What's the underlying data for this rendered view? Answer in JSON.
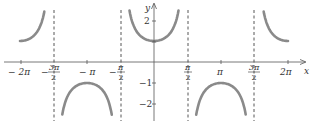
{
  "chart_data": {
    "type": "line",
    "title": "",
    "function": "y = sec x",
    "xlabel": "x",
    "ylabel": "y",
    "x_ticks": [
      "-2π",
      "-3π/2",
      "-π",
      "-π/2",
      "π/2",
      "π",
      "3π/2",
      "2π"
    ],
    "y_ticks": [
      "2",
      "-1",
      "-2"
    ],
    "xlim": [
      -6.6,
      6.9
    ],
    "ylim": [
      -2.7,
      2.9
    ],
    "asymptotes": [
      "-3π/2",
      "-π/2",
      "π/2",
      "3π/2"
    ],
    "series": [
      {
        "name": "sec x",
        "x_range": [
          -6.283,
          -4.9
        ],
        "note": "branch from (-2π,1) rising to asymptote x=-3π/2"
      },
      {
        "name": "sec x",
        "x_range": [
          -4.3,
          -1.98
        ],
        "note": "downward branch with max at (-π,-1)"
      },
      {
        "name": "sec x",
        "x_range": [
          -1.15,
          1.15
        ],
        "note": "upward branch with min at (0,1)"
      },
      {
        "name": "sec x",
        "x_range": [
          1.98,
          4.3
        ],
        "note": "downward branch with max at (π,-1)"
      },
      {
        "name": "sec x",
        "x_range": [
          4.9,
          6.283
        ],
        "note": "branch from asymptote x=3π/2 falling to (2π,1)"
      }
    ],
    "grid": false,
    "legend": null
  },
  "labels": {
    "x_axis": "x",
    "y_axis": "y",
    "x_ticks": {
      "neg_2pi": "− 2π",
      "neg_3pi_2_num": "3π",
      "neg_3pi_2_den": "2",
      "neg_pi": "− π",
      "neg_pi_2_num": "π",
      "neg_pi_2_den": "2",
      "pi_2_num": "π",
      "pi_2_den": "2",
      "pi": "π",
      "pi3_2_num": "3π",
      "pi3_2_den": "2",
      "two_pi": "2π"
    },
    "y_ticks": {
      "two": "2",
      "neg_one": "−1",
      "neg_two": "−2"
    }
  },
  "colors": {
    "curve": "#8a8a8a",
    "axis": "#555555",
    "asymptote": "#444444"
  }
}
